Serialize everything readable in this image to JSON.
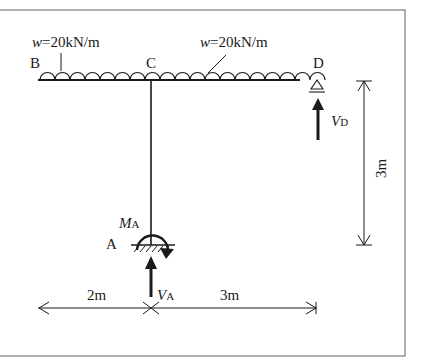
{
  "diagram": {
    "type": "structural-frame",
    "load_left": {
      "symbol": "w",
      "equals": "=",
      "value": "20kN/m"
    },
    "load_right": {
      "symbol": "w",
      "equals": "=",
      "value": "20kN/m"
    },
    "points": {
      "A": "A",
      "B": "B",
      "C": "C",
      "D": "D"
    },
    "reactions": {
      "moment_A": {
        "main": "M",
        "sub": "A"
      },
      "vertical_A": {
        "main": "V",
        "sub": "A"
      },
      "vertical_D": {
        "main": "V",
        "sub": "D"
      }
    },
    "dimensions": {
      "left_span": "2m",
      "right_span": "3m",
      "height": "3m"
    },
    "colors": {
      "line": "#1a1a1a",
      "frame": "#7a7a7a",
      "background": "#ffffff"
    }
  }
}
